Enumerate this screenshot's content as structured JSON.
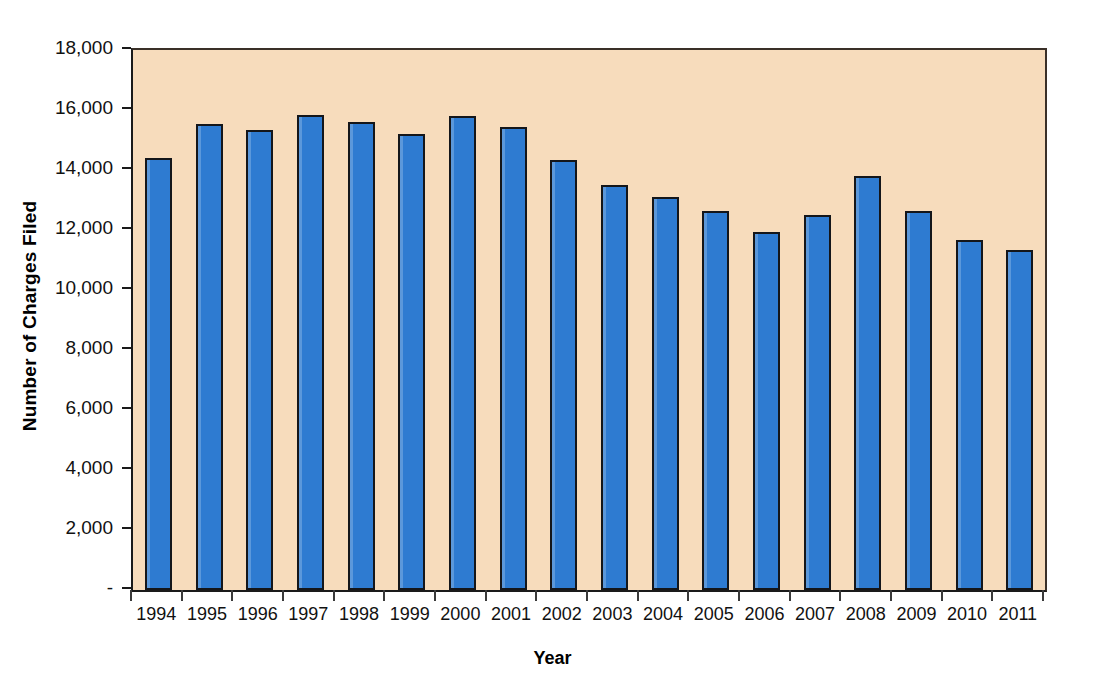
{
  "chart_data": {
    "type": "bar",
    "title": "",
    "subtitle": "",
    "xlabel": "Year",
    "ylabel": "Number of Charges Filed",
    "categories": [
      "1994",
      "1995",
      "1996",
      "1997",
      "1998",
      "1999",
      "2000",
      "2001",
      "2002",
      "2003",
      "2004",
      "2005",
      "2006",
      "2007",
      "2008",
      "2009",
      "2010",
      "2011"
    ],
    "values": [
      14400,
      15550,
      15350,
      15850,
      15600,
      15200,
      15800,
      15450,
      14350,
      13500,
      13100,
      12650,
      11950,
      12500,
      13800,
      12650,
      11670,
      11350
    ],
    "series": [
      {
        "name": "Number of Charges Filed",
        "values": [
          14400,
          15550,
          15350,
          15850,
          15600,
          15200,
          15800,
          15450,
          14350,
          13500,
          13100,
          12650,
          11950,
          12500,
          13800,
          12650,
          11670,
          11350
        ]
      }
    ],
    "ylim": [
      0,
      18000
    ],
    "ytick_values": [
      0,
      2000,
      4000,
      6000,
      8000,
      10000,
      12000,
      14000,
      16000,
      18000
    ],
    "ytick_labels": [
      "-",
      "2,000",
      "4,000",
      "6,000",
      "8,000",
      "10,000",
      "12,000",
      "14,000",
      "16,000",
      "18,000"
    ],
    "grid": false,
    "legend": false,
    "legend_position": "none",
    "bar_color": "#2E7BD1",
    "bar_border_color": "#14161A",
    "plot_background_color": "#F7DCBC",
    "axis_color": "#1A1A1A",
    "text_color": "#111111",
    "figure_background_color": "#FFFFFF"
  },
  "axes": {
    "x_title": "Year",
    "y_title": "Number of Charges Filed"
  }
}
